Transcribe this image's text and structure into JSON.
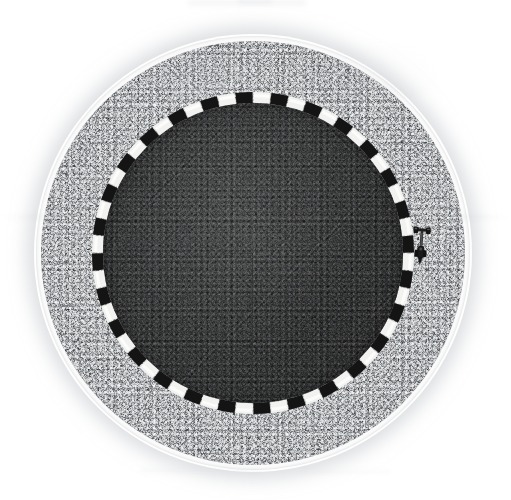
{
  "scene": {
    "title": "Top-down circular test track",
    "width": 511,
    "height": 500,
    "background_color": "#ffffff",
    "view": "overhead-orthographic",
    "center": {
      "x": 253,
      "y": 253
    }
  },
  "colors": {
    "background": "#ffffff",
    "outer_rim": "#fbfbfb",
    "apron_gravel": "#a9abad",
    "arena_asphalt": "#3b3c3d",
    "kerb_white": "#f2f2f0",
    "kerb_black": "#141414",
    "vehicle_body": "#1c1c1c",
    "shadow": "#bec1c6"
  },
  "layers": [
    {
      "name": "outer-rim",
      "label": "White outer rim",
      "shape": "ring",
      "radius_px": 217,
      "thickness_px": 5,
      "color": "#fbfbfb"
    },
    {
      "name": "gravel-apron",
      "label": "Gravel run-off apron",
      "shape": "disc",
      "radius_px": 212,
      "color": "#a9abad",
      "texture": "coarse-speckle"
    },
    {
      "name": "kerb-ring",
      "label": "Checkered kerb ring",
      "shape": "ring",
      "radius_px": 156,
      "thickness_px": 11,
      "segments": 56,
      "colors": [
        "#f2f2f0",
        "#141414"
      ]
    },
    {
      "name": "asphalt-arena",
      "label": "Asphalt arena surface",
      "shape": "disc",
      "radius_px": 150,
      "color": "#3b3c3d",
      "texture": "fine-asphalt-grain"
    }
  ],
  "kerb": {
    "label": "Checkered kerb",
    "segment_count": 56,
    "white_block_count": 28,
    "black_block_count": 28,
    "ring_radius_px": 156,
    "ring_thickness_px": 11,
    "white": "#f2f2f0",
    "black": "#141414"
  },
  "objects": [
    {
      "name": "vehicle",
      "label": "Small robot car",
      "position": {
        "x": 421,
        "y": 246
      },
      "heading_deg": 4,
      "width_px": 18,
      "length_px": 40,
      "color": "#1c1c1c"
    }
  ],
  "artifacts": {
    "label": "Faint scan smudges",
    "count": 8,
    "color": "#d6d8dc"
  }
}
